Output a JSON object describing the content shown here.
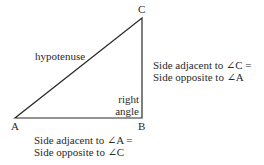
{
  "diagram": {
    "type": "right-triangle",
    "vertices": {
      "A": {
        "label": "A",
        "x": 15,
        "y": 118
      },
      "B": {
        "label": "B",
        "x": 142,
        "y": 118
      },
      "C": {
        "label": "C",
        "x": 142,
        "y": 18
      }
    },
    "hypotenuse_label": "hypotenuse",
    "right_angle_label": {
      "line1": "right",
      "line2": "angle"
    },
    "side_BC_label": {
      "line1": "Side adjacent to ∠C =",
      "line2": "Side opposite to ∠A"
    },
    "side_AB_label": {
      "line1": "Side adjacent to ∠A =",
      "line2": "Side opposite to ∠C"
    },
    "line_color": "#2a2a2a"
  }
}
